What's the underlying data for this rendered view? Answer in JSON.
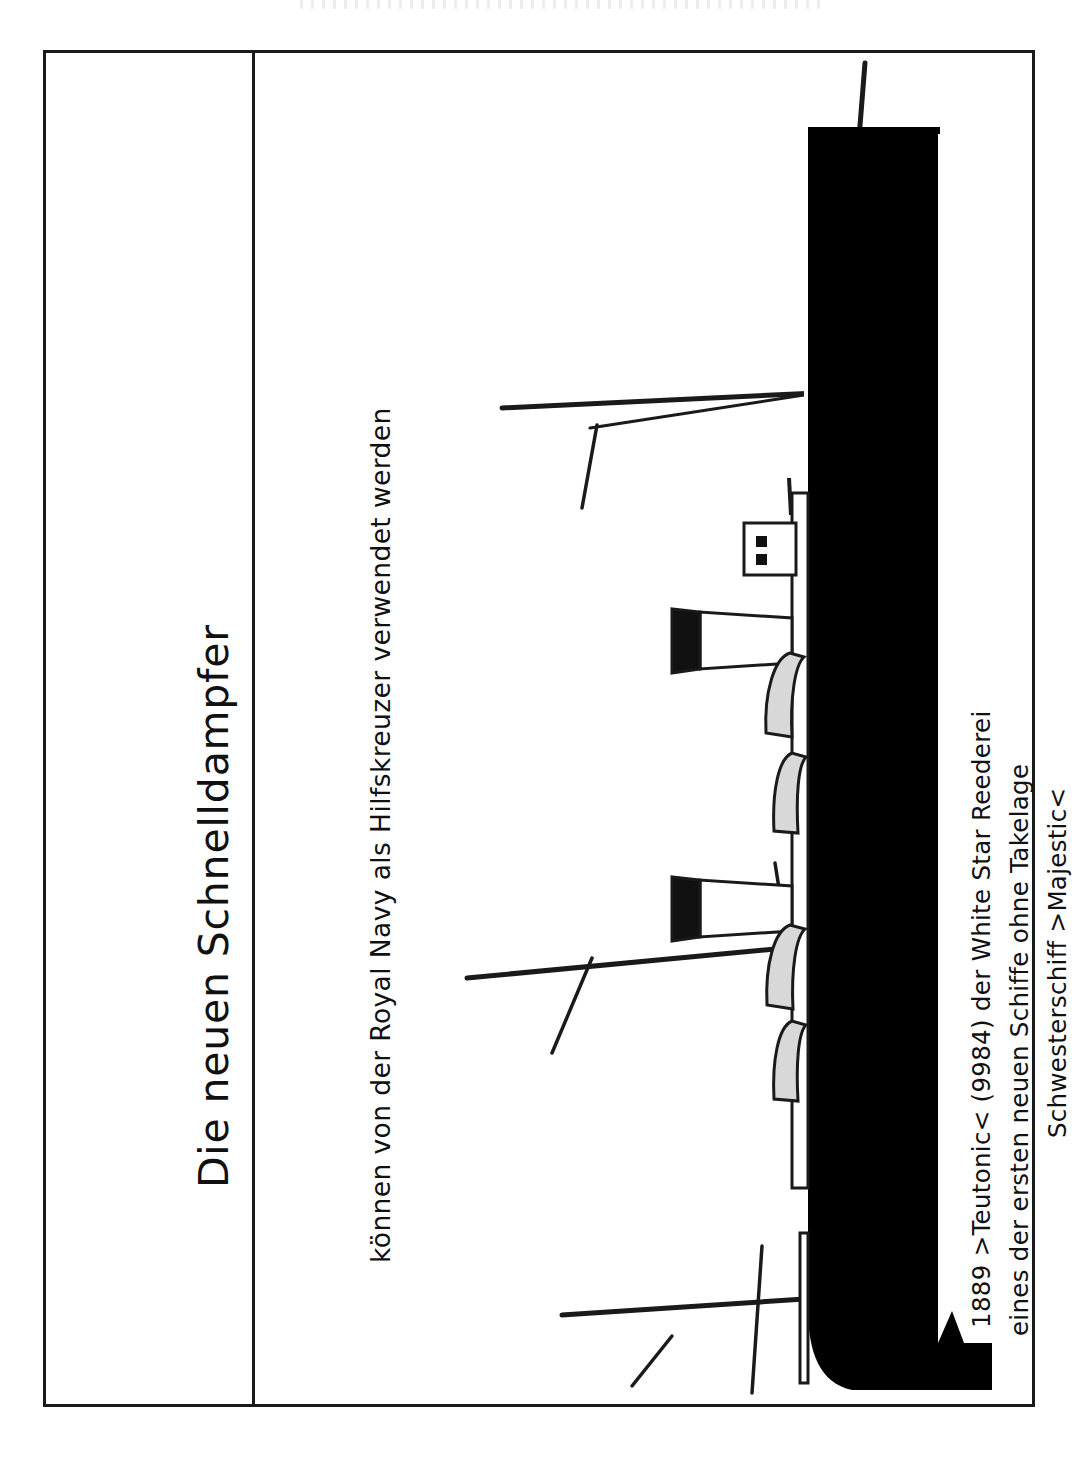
{
  "page": {
    "title": "Die neuen Schnelldampfer",
    "subtitle": "können von der Royal Navy als Hilfskreuzer verwendet werden",
    "orientation": "rotated-90-ccw",
    "border_color": "#1a1a1a",
    "background_color": "#ffffff",
    "ink_color": "#111111"
  },
  "figure": {
    "name": "teutonic-ship-line-drawing",
    "subject": "Teutonic",
    "hull_color": "#000000",
    "outline_color": "#1a1a1a",
    "funnel_top_color": "#000000",
    "funnel_body_color": "#ffffff",
    "vent_fill_color": "#d8d8d8",
    "funnels": 2,
    "masts": 2,
    "ventilators": 4,
    "bridge_windows": 2
  },
  "caption": {
    "lines": [
      "1889 >Teutonic< (9984) der White Star Reederei",
      "eines der ersten neuen Schiffe ohne Takelage",
      "Schwesterschiff >Majestic<"
    ]
  }
}
